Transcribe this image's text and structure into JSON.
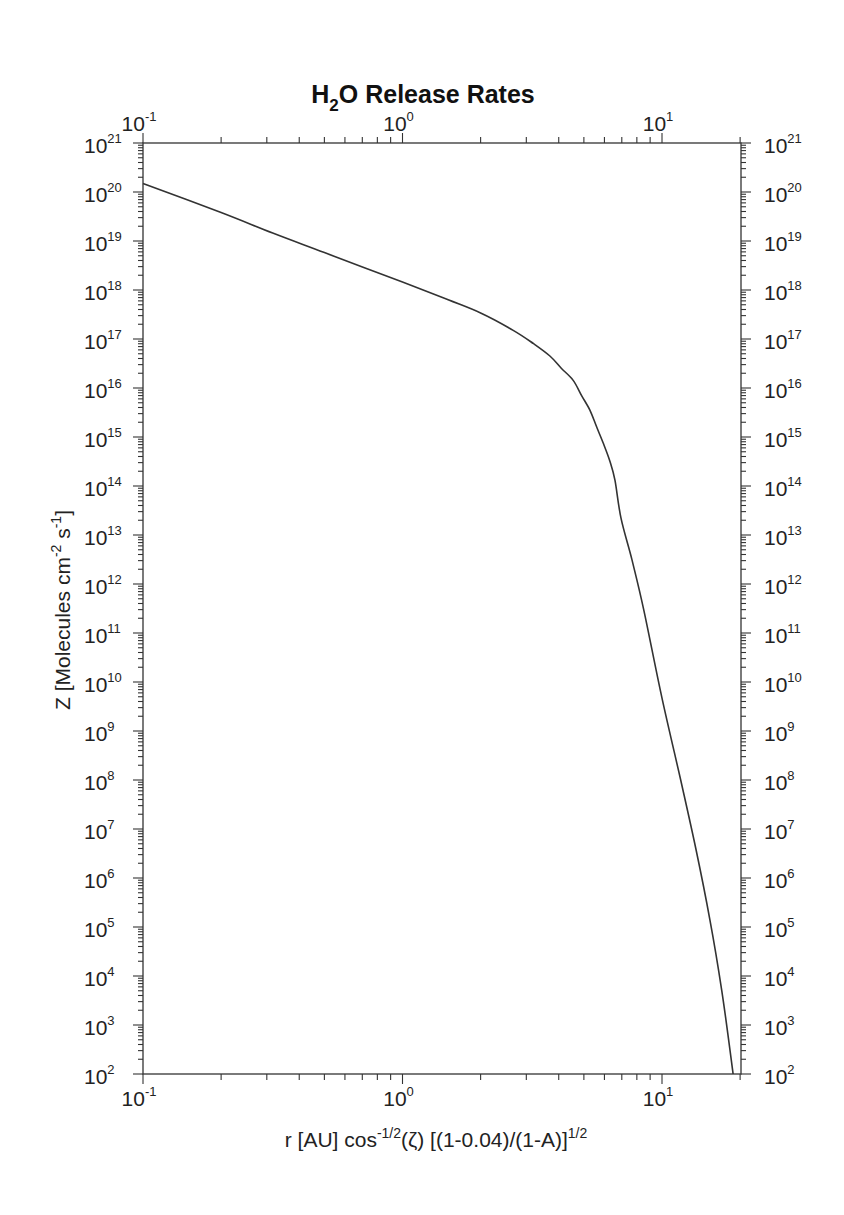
{
  "chart_data": {
    "type": "line",
    "title": "H2O Release Rates",
    "title_parts": {
      "pre": "H",
      "sub": "2",
      "post": "O Release Rates"
    },
    "xlabel": "r [AU] cos^-1/2(ζ) [(1-0.04)/(1-A)]^1/2",
    "xlabel_parts": {
      "a": "r [AU] cos",
      "a_sup": "-1/2",
      "b": "(ζ) [(1-0.04)/(1-A)]",
      "b_sup": "1/2"
    },
    "ylabel": "Z [Molecules cm^-2 s^-1]",
    "ylabel_parts": {
      "a": "Z [Molecules cm",
      "a_sup": "-2",
      "b": " s",
      "b_sup": "-1",
      "c": "]"
    },
    "xscale": "log",
    "yscale": "log",
    "xlim": [
      0.1,
      20
    ],
    "ylim": [
      100.0,
      1e+21
    ],
    "grid": false,
    "legend": null,
    "x_ticks": [
      {
        "value": 0.1,
        "base": "10",
        "exp": "-1"
      },
      {
        "value": 1,
        "base": "10",
        "exp": "0"
      },
      {
        "value": 10,
        "base": "10",
        "exp": "1"
      }
    ],
    "y_ticks": [
      {
        "value": 1e+21,
        "base": "10",
        "exp": "21"
      },
      {
        "value": 1e+20,
        "base": "10",
        "exp": "20"
      },
      {
        "value": 1e+19,
        "base": "10",
        "exp": "19"
      },
      {
        "value": 1e+18,
        "base": "10",
        "exp": "18"
      },
      {
        "value": 1e+17,
        "base": "10",
        "exp": "17"
      },
      {
        "value": 1e+16,
        "base": "10",
        "exp": "16"
      },
      {
        "value": 1000000000000000.0,
        "base": "10",
        "exp": "15"
      },
      {
        "value": 100000000000000.0,
        "base": "10",
        "exp": "14"
      },
      {
        "value": 10000000000000.0,
        "base": "10",
        "exp": "13"
      },
      {
        "value": 1000000000000.0,
        "base": "10",
        "exp": "12"
      },
      {
        "value": 100000000000.0,
        "base": "10",
        "exp": "11"
      },
      {
        "value": 10000000000.0,
        "base": "10",
        "exp": "10"
      },
      {
        "value": 1000000000.0,
        "base": "10",
        "exp": "9"
      },
      {
        "value": 100000000.0,
        "base": "10",
        "exp": "8"
      },
      {
        "value": 10000000.0,
        "base": "10",
        "exp": "7"
      },
      {
        "value": 1000000.0,
        "base": "10",
        "exp": "6"
      },
      {
        "value": 100000.0,
        "base": "10",
        "exp": "5"
      },
      {
        "value": 10000.0,
        "base": "10",
        "exp": "4"
      },
      {
        "value": 1000.0,
        "base": "10",
        "exp": "3"
      },
      {
        "value": 100.0,
        "base": "10",
        "exp": "2"
      }
    ],
    "series": [
      {
        "name": "H2O release rate",
        "x": [
          0.1,
          0.2,
          0.316,
          0.5,
          1.0,
          1.5,
          2.0,
          2.67,
          3.2,
          3.7,
          4.1,
          4.54,
          4.9,
          5.28,
          5.6,
          5.93,
          6.3,
          6.59,
          6.95,
          7.66,
          8.5,
          10.0,
          11.8,
          13.5,
          15.3,
          17.0,
          18.8
        ],
        "y": [
          1.5e+20,
          3.8e+19,
          1.45e+19,
          5.8e+18,
          1.45e+18,
          6.3e+17,
          3.4e+17,
          1.5e+17,
          8e+16,
          4.5e+16,
          2.5e+16,
          1.45e+16,
          7000000000000000.0,
          3500000000000000.0,
          1600000000000000.0,
          760000000000000.0,
          320000000000000.0,
          130000000000000.0,
          22000000000000.0,
          3100000000000.0,
          300000000000.0,
          4700000000.0,
          100000000.0,
          4000000.0,
          140000.0,
          5000.0,
          100.0
        ]
      }
    ]
  }
}
